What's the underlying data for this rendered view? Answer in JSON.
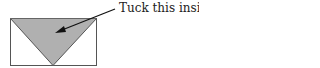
{
  "diagram": {
    "annotation": "Tuck this inside",
    "colors": {
      "triangle_fill": "#b0b0b0",
      "outline": "#555555",
      "arrow": "#111111",
      "background": "#ffffff"
    },
    "shapes": {
      "rectangle": "envelope-outline",
      "triangle": "flap",
      "arrow": "pointer-arrow"
    }
  }
}
